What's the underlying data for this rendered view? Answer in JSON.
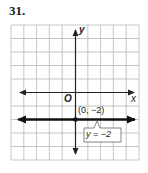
{
  "problem_number": "31.",
  "graph": {
    "x_axis_label": "x",
    "y_axis_label": "y",
    "origin_label": "O",
    "point_label": "(0, −2)",
    "line_label": "y = −2",
    "grid": {
      "cols": 10,
      "rows": 10,
      "x_range": [
        -5,
        5
      ],
      "y_range": [
        -5,
        5
      ]
    },
    "colors": {
      "grid": "#b8b8b8",
      "axis": "#222222",
      "line": "#111111",
      "border": "#9a9a9a"
    }
  }
}
